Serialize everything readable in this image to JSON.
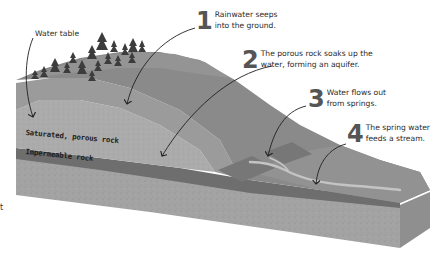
{
  "diagram": {
    "type": "aquifer-cross-section",
    "style": "grayscale",
    "labels": {
      "water_table": "Water table",
      "saturated_layer": "Saturated, porous rock",
      "impermeable_layer": "Impermeable rock",
      "edge_fragment": "t"
    },
    "callouts": [
      {
        "number": "1",
        "text": "Rainwater seeps\ninto the ground."
      },
      {
        "number": "2",
        "text": "The porous rock soaks up the\nwater, forming an aquifer."
      },
      {
        "number": "3",
        "text": "Water flows out\nfrom springs."
      },
      {
        "number": "4",
        "text": "The spring water\nfeeds a stream."
      }
    ],
    "colors": {
      "background": "#ffffff",
      "hill_surface": "#8c8c8c",
      "hill_top": "#9a9a9a",
      "saturated_rock": "#a8a8a8",
      "impermeable_rock": "#6e6e6e",
      "bedrock": "#a2a2a2",
      "bedrock_side": "#979797",
      "spring_patch": "#7a7a7a",
      "stream": "#c2c2c2",
      "trees": "#3c3c3c",
      "arrow": "#1f1f1f",
      "text": "#2a2a2a"
    }
  }
}
